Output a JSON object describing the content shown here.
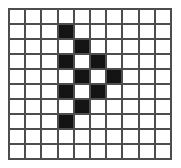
{
  "figure": {
    "name": "grid-pattern-figure",
    "background_color": "#ffffff",
    "grid_line_color": "#4d4d4d",
    "filled_cell_color": "#141414",
    "empty_cell_color": "#ffffff",
    "grid_line_width_px": 2
  },
  "chart_data": {
    "type": "heatmap",
    "title": "",
    "xlabel": "",
    "ylabel": "",
    "rows": 10,
    "columns": 10,
    "legend": [],
    "grid": true,
    "value_labels": {
      "0": "empty",
      "1": "filled"
    },
    "cells": [
      [
        0,
        0,
        0,
        0,
        0,
        0,
        0,
        0,
        0,
        0
      ],
      [
        0,
        0,
        0,
        1,
        0,
        0,
        0,
        0,
        0,
        0
      ],
      [
        0,
        0,
        0,
        0,
        1,
        0,
        0,
        0,
        0,
        0
      ],
      [
        0,
        0,
        0,
        1,
        0,
        1,
        0,
        0,
        0,
        0
      ],
      [
        0,
        0,
        0,
        0,
        1,
        0,
        1,
        0,
        0,
        0
      ],
      [
        0,
        0,
        0,
        1,
        0,
        1,
        0,
        0,
        0,
        0
      ],
      [
        0,
        0,
        0,
        0,
        1,
        0,
        0,
        0,
        0,
        0
      ],
      [
        0,
        0,
        0,
        1,
        0,
        0,
        0,
        0,
        0,
        0
      ],
      [
        0,
        0,
        0,
        0,
        0,
        0,
        0,
        0,
        0,
        0
      ],
      [
        0,
        0,
        0,
        0,
        0,
        0,
        0,
        0,
        0,
        0
      ]
    ],
    "filled_count": 10,
    "total_cells": 100
  }
}
